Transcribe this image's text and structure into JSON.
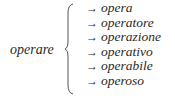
{
  "root_word": "operare",
  "arrow_symbol": "→",
  "derivatives": [
    {
      "word": "opera"
    },
    {
      "word": "operatore"
    },
    {
      "word": "operazione"
    },
    {
      "word": "operativo"
    },
    {
      "word": "operabile"
    },
    {
      "word": "operoso"
    }
  ]
}
